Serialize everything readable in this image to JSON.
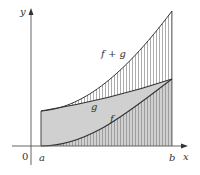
{
  "diagram": {
    "type": "area-under-curves",
    "labels": {
      "y_axis": "y",
      "x_axis": "x",
      "origin": "0",
      "a": "a",
      "b": "b",
      "f_plus_g": "f + g",
      "g": "g",
      "f": "f"
    },
    "colors": {
      "axis": "#555555",
      "curve": "#333333",
      "gray_fill": "#d0d0d0",
      "hatch": "#888888",
      "background": "#ffffff"
    }
  }
}
